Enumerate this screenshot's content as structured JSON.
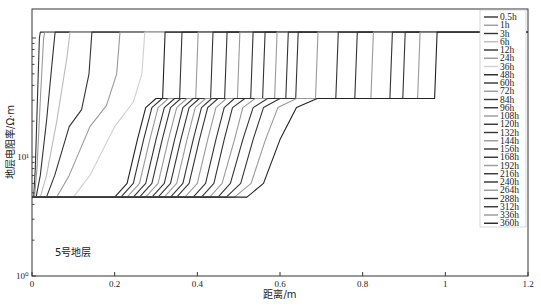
{
  "chart_data": {
    "type": "line",
    "title": "",
    "annotation": "5号地层",
    "xlabel": "距离/m",
    "ylabel": "地层电阻率/Ω·m",
    "xlim": [
      0,
      1.2
    ],
    "ylim": [
      1,
      175
    ],
    "yscale": "log",
    "x_ticks": [
      0,
      0.2,
      0.4,
      0.6,
      0.8,
      1,
      1.2
    ],
    "x_tick_labels": [
      "0",
      "0.2",
      "0.4",
      "0.6",
      "0.8",
      "1",
      "1.2"
    ],
    "y_ticks": [
      1,
      10
    ],
    "y_tick_labels": [
      "10⁰",
      "10¹"
    ],
    "grid": false,
    "legend_position": "upper right",
    "levels": {
      "baseline": 4.6,
      "mid_plateau": 31,
      "top": 112
    },
    "series": [
      {
        "name": "0.5h",
        "color": "#333333",
        "points": [
          [
            0,
            4.6
          ],
          [
            0.004,
            4.6
          ],
          [
            0.008,
            8
          ],
          [
            0.013,
            30
          ],
          [
            0.018,
            100
          ],
          [
            0.02,
            112
          ],
          [
            1.2,
            112
          ]
        ]
      },
      {
        "name": "1h",
        "color": "#999999",
        "points": [
          [
            0,
            4.6
          ],
          [
            0.006,
            4.6
          ],
          [
            0.012,
            8
          ],
          [
            0.02,
            30
          ],
          [
            0.028,
            100
          ],
          [
            0.031,
            112
          ],
          [
            1.2,
            112
          ]
        ]
      },
      {
        "name": "3h",
        "color": "#333333",
        "points": [
          [
            0,
            4.6
          ],
          [
            0.01,
            4.6
          ],
          [
            0.02,
            7
          ],
          [
            0.035,
            20
          ],
          [
            0.05,
            70
          ],
          [
            0.056,
            112
          ],
          [
            1.2,
            112
          ]
        ]
      },
      {
        "name": "6h",
        "color": "#bbbbbb",
        "points": [
          [
            0,
            4.6
          ],
          [
            0.02,
            4.6
          ],
          [
            0.035,
            7
          ],
          [
            0.06,
            20
          ],
          [
            0.085,
            70
          ],
          [
            0.092,
            112
          ],
          [
            1.2,
            112
          ]
        ]
      },
      {
        "name": "12h",
        "color": "#333333",
        "points": [
          [
            0,
            4.6
          ],
          [
            0.035,
            4.6
          ],
          [
            0.055,
            7
          ],
          [
            0.09,
            18
          ],
          [
            0.12,
            25
          ],
          [
            0.138,
            50
          ],
          [
            0.145,
            112
          ],
          [
            1.2,
            112
          ]
        ]
      },
      {
        "name": "24h",
        "color": "#999999",
        "points": [
          [
            0,
            4.6
          ],
          [
            0.06,
            4.6
          ],
          [
            0.09,
            7
          ],
          [
            0.14,
            18
          ],
          [
            0.18,
            27
          ],
          [
            0.205,
            50
          ],
          [
            0.213,
            112
          ],
          [
            1.2,
            112
          ]
        ]
      },
      {
        "name": "36h",
        "color": "#d0d0d0",
        "points": [
          [
            0,
            4.6
          ],
          [
            0.1,
            4.6
          ],
          [
            0.14,
            7
          ],
          [
            0.2,
            18
          ],
          [
            0.245,
            29
          ],
          [
            0.266,
            50
          ],
          [
            0.273,
            112
          ],
          [
            1.2,
            112
          ]
        ]
      },
      {
        "name": "48h",
        "color": "#222222",
        "points": [
          [
            0,
            4.6
          ],
          [
            0.2,
            4.6
          ],
          [
            0.23,
            6
          ],
          [
            0.255,
            14
          ],
          [
            0.275,
            26
          ],
          [
            0.3,
            31
          ],
          [
            0.316,
            31
          ],
          [
            0.322,
            112
          ],
          [
            1.2,
            112
          ]
        ]
      },
      {
        "name": "60h",
        "color": "#333333",
        "points": [
          [
            0,
            4.6
          ],
          [
            0.215,
            4.6
          ],
          [
            0.245,
            6
          ],
          [
            0.27,
            14
          ],
          [
            0.29,
            26
          ],
          [
            0.315,
            31
          ],
          [
            0.357,
            31
          ],
          [
            0.363,
            112
          ],
          [
            1.2,
            112
          ]
        ]
      },
      {
        "name": "72h",
        "color": "#999999",
        "points": [
          [
            0,
            4.6
          ],
          [
            0.23,
            4.6
          ],
          [
            0.26,
            6
          ],
          [
            0.285,
            14
          ],
          [
            0.305,
            26
          ],
          [
            0.33,
            31
          ],
          [
            0.396,
            31
          ],
          [
            0.402,
            112
          ],
          [
            1.2,
            112
          ]
        ]
      },
      {
        "name": "84h",
        "color": "#333333",
        "points": [
          [
            0,
            4.6
          ],
          [
            0.245,
            4.6
          ],
          [
            0.275,
            6
          ],
          [
            0.3,
            14
          ],
          [
            0.32,
            26
          ],
          [
            0.345,
            31
          ],
          [
            0.432,
            31
          ],
          [
            0.438,
            112
          ],
          [
            1.2,
            112
          ]
        ]
      },
      {
        "name": "96h",
        "color": "#333333",
        "points": [
          [
            0,
            4.6
          ],
          [
            0.26,
            4.6
          ],
          [
            0.29,
            6
          ],
          [
            0.315,
            14
          ],
          [
            0.335,
            26
          ],
          [
            0.36,
            31
          ],
          [
            0.466,
            31
          ],
          [
            0.472,
            112
          ],
          [
            1.2,
            112
          ]
        ]
      },
      {
        "name": "108h",
        "color": "#999999",
        "points": [
          [
            0,
            4.6
          ],
          [
            0.275,
            4.6
          ],
          [
            0.305,
            6
          ],
          [
            0.33,
            14
          ],
          [
            0.35,
            26
          ],
          [
            0.375,
            31
          ],
          [
            0.497,
            31
          ],
          [
            0.503,
            112
          ],
          [
            1.2,
            112
          ]
        ]
      },
      {
        "name": "120h",
        "color": "#333333",
        "points": [
          [
            0,
            4.6
          ],
          [
            0.29,
            4.6
          ],
          [
            0.32,
            6
          ],
          [
            0.345,
            14
          ],
          [
            0.365,
            26
          ],
          [
            0.39,
            31
          ],
          [
            0.529,
            31
          ],
          [
            0.535,
            112
          ],
          [
            1.2,
            112
          ]
        ]
      },
      {
        "name": "132h",
        "color": "#333333",
        "points": [
          [
            0,
            4.6
          ],
          [
            0.305,
            4.6
          ],
          [
            0.335,
            6
          ],
          [
            0.36,
            14
          ],
          [
            0.38,
            26
          ],
          [
            0.405,
            31
          ],
          [
            0.558,
            31
          ],
          [
            0.564,
            112
          ],
          [
            1.2,
            112
          ]
        ]
      },
      {
        "name": "144h",
        "color": "#999999",
        "points": [
          [
            0,
            4.6
          ],
          [
            0.32,
            4.6
          ],
          [
            0.35,
            6
          ],
          [
            0.375,
            14
          ],
          [
            0.395,
            26
          ],
          [
            0.42,
            31
          ],
          [
            0.587,
            31
          ],
          [
            0.593,
            112
          ],
          [
            1.2,
            112
          ]
        ]
      },
      {
        "name": "156h",
        "color": "#333333",
        "points": [
          [
            0,
            4.6
          ],
          [
            0.335,
            4.6
          ],
          [
            0.365,
            6
          ],
          [
            0.39,
            14
          ],
          [
            0.41,
            26
          ],
          [
            0.435,
            31
          ],
          [
            0.614,
            31
          ],
          [
            0.62,
            112
          ],
          [
            1.2,
            112
          ]
        ]
      },
      {
        "name": "168h",
        "color": "#333333",
        "points": [
          [
            0,
            4.6
          ],
          [
            0.35,
            4.6
          ],
          [
            0.38,
            6
          ],
          [
            0.405,
            14
          ],
          [
            0.425,
            26
          ],
          [
            0.45,
            31
          ],
          [
            0.638,
            31
          ],
          [
            0.644,
            112
          ],
          [
            1.2,
            112
          ]
        ]
      },
      {
        "name": "192h",
        "color": "#999999",
        "points": [
          [
            0,
            4.6
          ],
          [
            0.37,
            4.6
          ],
          [
            0.4,
            6
          ],
          [
            0.425,
            14
          ],
          [
            0.445,
            26
          ],
          [
            0.47,
            31
          ],
          [
            0.686,
            31
          ],
          [
            0.692,
            112
          ],
          [
            1.2,
            112
          ]
        ]
      },
      {
        "name": "216h",
        "color": "#333333",
        "points": [
          [
            0,
            4.6
          ],
          [
            0.39,
            4.6
          ],
          [
            0.42,
            6
          ],
          [
            0.445,
            14
          ],
          [
            0.465,
            26
          ],
          [
            0.49,
            31
          ],
          [
            0.735,
            31
          ],
          [
            0.741,
            112
          ],
          [
            1.2,
            112
          ]
        ]
      },
      {
        "name": "240h",
        "color": "#333333",
        "points": [
          [
            0,
            4.6
          ],
          [
            0.41,
            4.6
          ],
          [
            0.44,
            6
          ],
          [
            0.465,
            14
          ],
          [
            0.485,
            26
          ],
          [
            0.515,
            31
          ],
          [
            0.781,
            31
          ],
          [
            0.787,
            112
          ],
          [
            1.2,
            112
          ]
        ]
      },
      {
        "name": "264h",
        "color": "#999999",
        "points": [
          [
            0,
            4.6
          ],
          [
            0.43,
            4.6
          ],
          [
            0.46,
            6
          ],
          [
            0.49,
            14
          ],
          [
            0.51,
            26
          ],
          [
            0.54,
            31
          ],
          [
            0.82,
            31
          ],
          [
            0.826,
            112
          ],
          [
            1.2,
            112
          ]
        ]
      },
      {
        "name": "288h",
        "color": "#333333",
        "points": [
          [
            0,
            4.6
          ],
          [
            0.45,
            4.6
          ],
          [
            0.48,
            6
          ],
          [
            0.51,
            14
          ],
          [
            0.535,
            26
          ],
          [
            0.57,
            31
          ],
          [
            0.866,
            31
          ],
          [
            0.872,
            112
          ],
          [
            1.2,
            112
          ]
        ]
      },
      {
        "name": "312h",
        "color": "#333333",
        "points": [
          [
            0,
            4.6
          ],
          [
            0.47,
            4.6
          ],
          [
            0.505,
            6
          ],
          [
            0.535,
            14
          ],
          [
            0.56,
            26
          ],
          [
            0.6,
            31
          ],
          [
            0.897,
            31
          ],
          [
            0.903,
            112
          ],
          [
            1.2,
            112
          ]
        ]
      },
      {
        "name": "336h",
        "color": "#999999",
        "points": [
          [
            0,
            4.6
          ],
          [
            0.49,
            4.6
          ],
          [
            0.53,
            6
          ],
          [
            0.565,
            14
          ],
          [
            0.595,
            26
          ],
          [
            0.64,
            31
          ],
          [
            0.933,
            31
          ],
          [
            0.939,
            112
          ],
          [
            1.2,
            112
          ]
        ]
      },
      {
        "name": "360h",
        "color": "#222222",
        "points": [
          [
            0,
            4.6
          ],
          [
            0.52,
            4.6
          ],
          [
            0.56,
            6
          ],
          [
            0.6,
            14
          ],
          [
            0.64,
            26
          ],
          [
            0.69,
            31
          ],
          [
            0.76,
            31
          ],
          [
            0.974,
            31
          ],
          [
            0.98,
            112
          ],
          [
            1.2,
            112
          ]
        ]
      }
    ]
  }
}
